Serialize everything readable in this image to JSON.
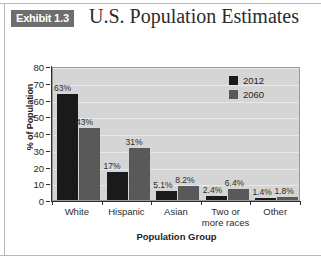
{
  "header": {
    "exhibit_badge": "Exhibit 1.3",
    "title": "U.S. Population Estimates"
  },
  "chart_data": {
    "type": "bar",
    "title": "U.S. Population Estimates",
    "xlabel": "Population Group",
    "ylabel": "% of Population",
    "ylim": [
      0,
      80
    ],
    "yticks": [
      "0",
      "10",
      "20",
      "30",
      "40",
      "50",
      "60",
      "70",
      "80"
    ],
    "grid": true,
    "legend_position": "top-right",
    "categories": [
      "White",
      "Hispanic",
      "Asian",
      "Two or more races",
      "Other"
    ],
    "series": [
      {
        "name": "2012",
        "color": "#1a1a1a",
        "values": [
          63,
          17,
          5.1,
          2.4,
          1.4
        ],
        "labels": [
          "63%",
          "17%",
          "5.1%",
          "2.4%",
          "1.4%"
        ]
      },
      {
        "name": "2060",
        "color": "#595959",
        "values": [
          43,
          31,
          8.2,
          6.4,
          1.8
        ],
        "labels": [
          "43%",
          "31%",
          "8.2%",
          "6.4%",
          "1.8%"
        ]
      }
    ]
  },
  "legend": {
    "items": [
      {
        "label": "2012",
        "color": "#1a1a1a"
      },
      {
        "label": "2060",
        "color": "#595959"
      }
    ]
  }
}
